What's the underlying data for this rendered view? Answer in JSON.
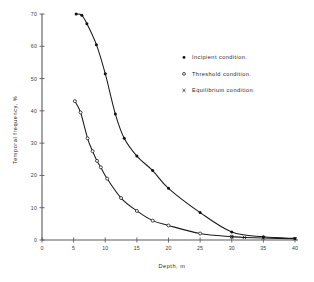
{
  "chart_data": {
    "type": "scatter",
    "title": "",
    "xlabel": "Depth, m",
    "ylabel": "Temporal frequency, %",
    "xlim": [
      0,
      40
    ],
    "ylim": [
      0,
      70
    ],
    "xticks": [
      0,
      5,
      10,
      15,
      20,
      25,
      30,
      35,
      40
    ],
    "yticks": [
      0,
      10,
      20,
      30,
      40,
      50,
      60,
      70
    ],
    "xtick_labels": [
      "0",
      "5",
      "10",
      "15",
      "20",
      "25",
      "30",
      "35",
      "40"
    ],
    "ytick_labels": [
      "0",
      "10",
      "20",
      "30",
      "40",
      "50",
      "60",
      "70"
    ],
    "grid": false,
    "legend_position": "upper-right",
    "series": [
      {
        "name": "Incipient condition.",
        "marker": "filled-circle",
        "points": [
          {
            "x": 5.4,
            "y": 70.0
          },
          {
            "x": 6.3,
            "y": 69.6
          },
          {
            "x": 7.1,
            "y": 67.0
          },
          {
            "x": 8.6,
            "y": 60.5
          },
          {
            "x": 10.0,
            "y": 51.5
          },
          {
            "x": 11.6,
            "y": 39.0
          },
          {
            "x": 13.0,
            "y": 31.5
          },
          {
            "x": 15.0,
            "y": 26.0
          },
          {
            "x": 17.5,
            "y": 21.5
          },
          {
            "x": 20.0,
            "y": 16.0
          },
          {
            "x": 25.0,
            "y": 8.5
          },
          {
            "x": 30.0,
            "y": 2.5
          },
          {
            "x": 35.0,
            "y": 1.0
          },
          {
            "x": 40.0,
            "y": 0.5
          }
        ]
      },
      {
        "name": "Threshold condition.",
        "marker": "open-circle",
        "points": [
          {
            "x": 5.2,
            "y": 43.0
          },
          {
            "x": 6.1,
            "y": 39.5
          },
          {
            "x": 7.2,
            "y": 31.5
          },
          {
            "x": 8.0,
            "y": 27.5
          },
          {
            "x": 8.7,
            "y": 24.5
          },
          {
            "x": 9.3,
            "y": 22.5
          },
          {
            "x": 10.3,
            "y": 19.0
          },
          {
            "x": 12.5,
            "y": 13.0
          },
          {
            "x": 15.0,
            "y": 9.0
          },
          {
            "x": 17.5,
            "y": 6.0
          },
          {
            "x": 20.0,
            "y": 4.5
          },
          {
            "x": 25.0,
            "y": 2.0
          },
          {
            "x": 30.0,
            "y": 1.0
          }
        ]
      },
      {
        "name": "Equilibrium condition.",
        "marker": "cross",
        "points": [
          {
            "x": 30.0,
            "y": 1.0
          },
          {
            "x": 32.0,
            "y": 0.8
          },
          {
            "x": 35.0,
            "y": 0.6
          },
          {
            "x": 40.0,
            "y": 0.4
          }
        ]
      }
    ]
  },
  "legend": {
    "items": [
      {
        "marker": "filled-circle",
        "label": "Incipient condition."
      },
      {
        "marker": "open-circle",
        "label": "Threshold condition."
      },
      {
        "marker": "cross",
        "label": "Equilibrium condition."
      }
    ]
  },
  "colors": {
    "axis": "#5a5a5a",
    "curve": "#1a1a1a",
    "marker": "#111111",
    "background": "#ffffff"
  }
}
